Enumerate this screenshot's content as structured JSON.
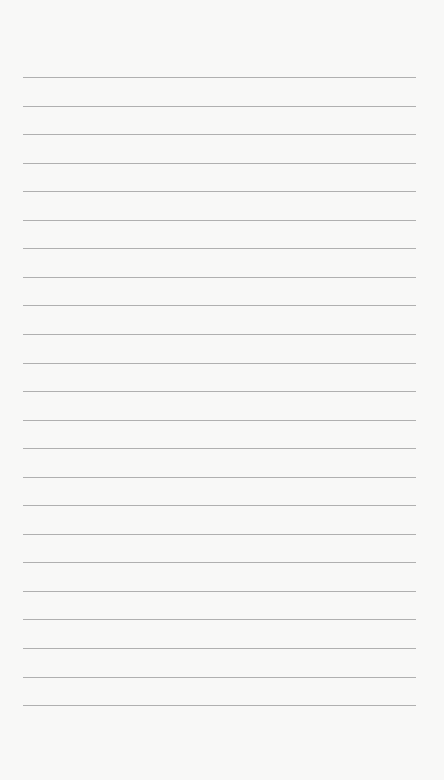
{
  "page": {
    "type": "lined-paper",
    "background_color": "#f8f8f7",
    "line_color": "#b0b0b0",
    "line_count": 23,
    "first_line_y": 77,
    "line_spacing": 28.55,
    "line_left": 23,
    "line_right": 416
  }
}
